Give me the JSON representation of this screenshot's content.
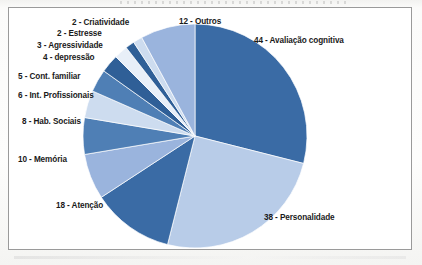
{
  "figure": {
    "background_color": "#ffffff",
    "frame_border_color": "#9a9a9a",
    "page_tint_color": "#fbfbfa"
  },
  "labels": {
    "criatividade": "2 - Criatividade",
    "estresse": "2 - Estresse",
    "agressividade": "3 - Agressividade",
    "depressao": "4 - depressão",
    "cont_familiar": "5 - Cont. familiar",
    "int_profissionais": "6 - Int. Profissionais",
    "hab_sociais": "8 - Hab. Sociais",
    "memoria": "10 - Memória",
    "atencao": "18 - Atenção",
    "outros": "12 - Outros",
    "avaliacao_cognitiva": "44 - Avaliação cognitiva",
    "personalidade": "38 - Personalidade"
  },
  "chart_data": {
    "type": "pie",
    "title": "",
    "legend": "none",
    "data_labels_position": "outside",
    "start_angle_deg": 0,
    "direction": "clockwise",
    "total": 152,
    "categories": [
      "Avaliação cognitiva",
      "Personalidade",
      "Atenção",
      "Memória",
      "Hab. Sociais",
      "Int. Profissionais",
      "Cont. familiar",
      "depressão",
      "Agressividade",
      "Estresse",
      "Criatividade",
      "Outros"
    ],
    "values": [
      44,
      38,
      18,
      10,
      8,
      6,
      5,
      4,
      3,
      2,
      2,
      12
    ],
    "labels": [
      "44 - Avaliação cognitiva",
      "38 - Personalidade",
      "18 - Atenção",
      "10 - Memória",
      "8 - Hab. Sociais",
      "6 - Int. Profissionais",
      "5 - Cont. familiar",
      "4 - depressão",
      "3 - Agressividade",
      "2 - Estresse",
      "2 - Criatividade",
      "12 - Outros"
    ],
    "colors": [
      "#3a6ba5",
      "#b8cce8",
      "#3a6ba5",
      "#9ab4dd",
      "#4f7fb5",
      "#cddcef",
      "#4f7fb5",
      "#2f5f97",
      "#e8eff8",
      "#2f5f97",
      "#cddcef",
      "#9ab4dd"
    ],
    "slice_geometry": [
      {
        "label": "44 - Avaliação cognitiva",
        "start_deg": 0,
        "end_deg": 104.2
      },
      {
        "label": "38 - Personalidade",
        "start_deg": 104.2,
        "end_deg": 194.2
      },
      {
        "label": "18 - Atenção",
        "start_deg": 194.2,
        "end_deg": 236.8
      },
      {
        "label": "10 - Memória",
        "start_deg": 236.8,
        "end_deg": 260.5
      },
      {
        "label": "8 - Hab. Sociais",
        "start_deg": 260.5,
        "end_deg": 279.5
      },
      {
        "label": "6 - Int. Profissionais",
        "start_deg": 279.5,
        "end_deg": 293.7
      },
      {
        "label": "5 - Cont. familiar",
        "start_deg": 293.7,
        "end_deg": 305.5
      },
      {
        "label": "4 - depressão",
        "start_deg": 305.5,
        "end_deg": 315.0
      },
      {
        "label": "3 - Agressividade",
        "start_deg": 315.0,
        "end_deg": 322.1
      },
      {
        "label": "2 - Estresse",
        "start_deg": 322.1,
        "end_deg": 326.8
      },
      {
        "label": "2 - Criatividade",
        "start_deg": 326.8,
        "end_deg": 331.6
      },
      {
        "label": "12 - Outros",
        "start_deg": 331.6,
        "end_deg": 360.0
      }
    ]
  }
}
